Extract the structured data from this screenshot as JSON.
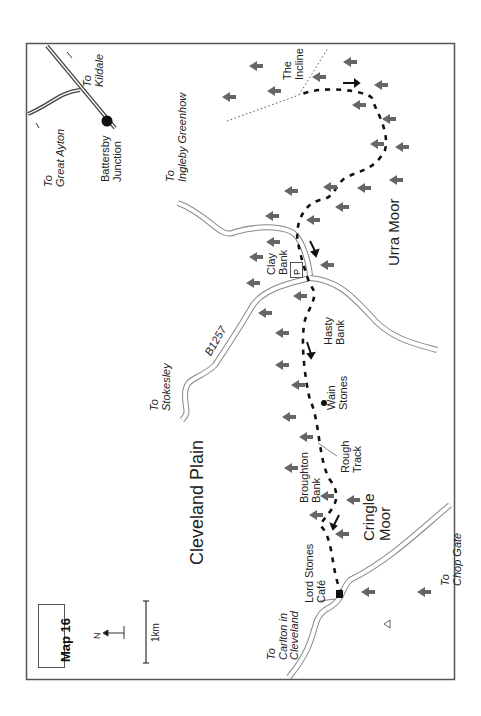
{
  "map": {
    "title": "Map 16",
    "north_label": "N",
    "scale_label": "1km",
    "parking_label": "P",
    "colors": {
      "frame": "#555555",
      "road": "#777777",
      "route": "#111111",
      "tree": "#666666",
      "text": "#222222"
    },
    "regions": {
      "cleveland_plain": "Cleveland Plain",
      "urra_moor": "Urra Moor",
      "cringle_moor": [
        "Cringle",
        "Moor"
      ]
    },
    "places": {
      "battersby_junction": [
        "Battersby",
        "Junction"
      ],
      "the_incline": [
        "The",
        "Incline"
      ],
      "clay_bank": [
        "Clay",
        "Bank"
      ],
      "hasty_bank": [
        "Hasty",
        "Bank"
      ],
      "wain_stones": [
        "Wain",
        "Stones"
      ],
      "rough_track": [
        "Rough",
        "Track"
      ],
      "broughton_bank": [
        "Broughton",
        "Bank"
      ],
      "lord_stones_cafe": [
        "Lord Stones",
        "Café"
      ]
    },
    "road_label": "B1257",
    "directions": {
      "kildale": [
        "To",
        "Kildale"
      ],
      "great_ayton": [
        "To",
        "Great Ayton"
      ],
      "ingleby_greenhow": [
        "To",
        "Ingleby Greenhow"
      ],
      "stokesley": [
        "To",
        "Stokesley"
      ],
      "carlton": [
        "To",
        "Carlton in",
        "Cleveland"
      ],
      "chop_gate": [
        "To",
        "Chop Gate"
      ]
    }
  }
}
